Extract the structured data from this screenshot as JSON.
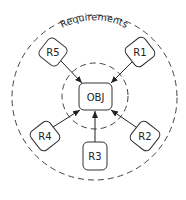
{
  "diagram": {
    "outer_label": "Requirements",
    "center": {
      "label": "OBJ"
    },
    "nodes": [
      {
        "id": "R1",
        "label": "R1"
      },
      {
        "id": "R2",
        "label": "R2"
      },
      {
        "id": "R3",
        "label": "R3"
      },
      {
        "id": "R4",
        "label": "R4"
      },
      {
        "id": "R5",
        "label": "R5"
      }
    ],
    "edges": [
      {
        "from": "R1",
        "to": "OBJ"
      },
      {
        "from": "R2",
        "to": "OBJ"
      },
      {
        "from": "R3",
        "to": "OBJ"
      },
      {
        "from": "R4",
        "to": "OBJ"
      },
      {
        "from": "R5",
        "to": "OBJ"
      }
    ],
    "colors": {
      "stroke": "#333333",
      "background": "#ffffff"
    }
  }
}
